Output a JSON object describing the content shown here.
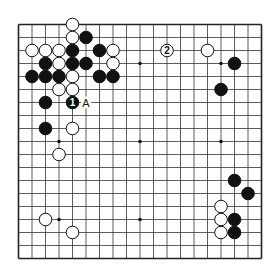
{
  "diagram": {
    "type": "go-board",
    "size": 19,
    "board_color": "#ffffff",
    "line_color": "#333333",
    "edge_color": "#222222",
    "black_color": "#111111",
    "white_color": "#ffffff",
    "star_points": [
      [
        3,
        3
      ],
      [
        9,
        3
      ],
      [
        15,
        3
      ],
      [
        3,
        9
      ],
      [
        9,
        9
      ],
      [
        15,
        9
      ],
      [
        3,
        15
      ],
      [
        9,
        15
      ],
      [
        15,
        15
      ]
    ],
    "black_stones": [
      {
        "col": 5,
        "row": 1
      },
      {
        "col": 4,
        "row": 2
      },
      {
        "col": 6,
        "row": 2
      },
      {
        "col": 2,
        "row": 3
      },
      {
        "col": 4,
        "row": 3
      },
      {
        "col": 5,
        "row": 3
      },
      {
        "col": 1,
        "row": 4
      },
      {
        "col": 2,
        "row": 4
      },
      {
        "col": 3,
        "row": 4
      },
      {
        "col": 6,
        "row": 4
      },
      {
        "col": 7,
        "row": 4
      },
      {
        "col": 2,
        "row": 6
      },
      {
        "col": 4,
        "row": 6,
        "label": "1"
      },
      {
        "col": 2,
        "row": 8
      },
      {
        "col": 16,
        "row": 3
      },
      {
        "col": 15,
        "row": 5
      },
      {
        "col": 16,
        "row": 12
      },
      {
        "col": 17,
        "row": 13
      },
      {
        "col": 16,
        "row": 15
      },
      {
        "col": 16,
        "row": 16
      }
    ],
    "white_stones": [
      {
        "col": 4,
        "row": 0
      },
      {
        "col": 4,
        "row": 1
      },
      {
        "col": 1,
        "row": 2
      },
      {
        "col": 2,
        "row": 2
      },
      {
        "col": 3,
        "row": 2
      },
      {
        "col": 7,
        "row": 2
      },
      {
        "col": 3,
        "row": 3
      },
      {
        "col": 7,
        "row": 3
      },
      {
        "col": 4,
        "row": 4
      },
      {
        "col": 3,
        "row": 5
      },
      {
        "col": 4,
        "row": 5
      },
      {
        "col": 4,
        "row": 8
      },
      {
        "col": 3,
        "row": 10
      },
      {
        "col": 11,
        "row": 2,
        "label": "2"
      },
      {
        "col": 14,
        "row": 2
      },
      {
        "col": 15,
        "row": 14
      },
      {
        "col": 15,
        "row": 15
      },
      {
        "col": 15,
        "row": 16
      },
      {
        "col": 2,
        "row": 15
      },
      {
        "col": 4,
        "row": 16
      }
    ],
    "point_labels": [
      {
        "col": 5,
        "row": 6,
        "text": "A"
      }
    ]
  }
}
